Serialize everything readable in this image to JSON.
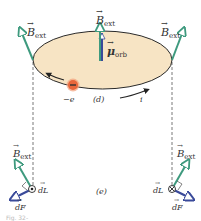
{
  "figure": {
    "panel_d_label": "(d)",
    "panel_e_label": "(e)",
    "caption_fragment": "Fig. 32-",
    "colors": {
      "disk_fill": "#f7e4c4",
      "disk_outline": "#2a2a2a",
      "b_ext_arrow": "#3e9a7e",
      "mu_arrow_blue": "#3a4a9a",
      "mu_arrow_green": "#3e9a7e",
      "force_arrow": "#3a4a9a",
      "electron": "#e8663a",
      "dashed_line": "#555555"
    }
  },
  "labels": {
    "b_ext": "B",
    "b_ext_sub": "ext",
    "mu": "μ",
    "mu_sub": "orb",
    "electron_charge": "−e",
    "current": "i",
    "dL": "dL",
    "dF": "dF"
  }
}
